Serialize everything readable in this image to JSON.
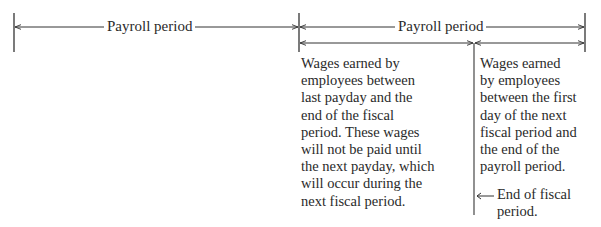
{
  "diagram": {
    "colors": {
      "line": "#333333",
      "text": "#2a2a2a",
      "background": "#ffffff"
    },
    "timeline": {
      "periods": [
        {
          "label": "Payroll period"
        },
        {
          "label": "Payroll period"
        }
      ]
    },
    "segments": {
      "left": {
        "text": "Wages earned by\nemployees between\nlast payday and the\nend of the fiscal\nperiod. These wages\nwill not be paid until\nthe next payday, which\nwill occur during the\nnext fiscal period."
      },
      "right": {
        "text": "Wages earned\nby employees\nbetween the first\nday of the next\nfiscal period and\nthe end of the\npayroll period."
      }
    },
    "marker": {
      "icon": "arrow-left-icon",
      "label": "End of fiscal\nperiod."
    }
  }
}
